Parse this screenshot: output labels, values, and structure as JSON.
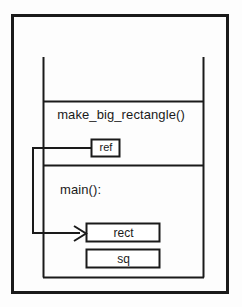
{
  "diagram": {
    "type": "memory-reference-diagram",
    "colors": {
      "stroke": "#1a1a1a",
      "background": "#fdfdfd",
      "text": "#1a1a1a"
    },
    "outer_border": {
      "name": "outer-border",
      "x": 12,
      "y": 15,
      "width": 216,
      "height": 278,
      "stroke_width": 3
    },
    "stack_frame": {
      "name": "stack-frame-column",
      "left_x": 43,
      "right_x": 203,
      "top_y": 57,
      "bottom_y": 277,
      "stroke_width": 2,
      "dividers": [
        101,
        165
      ]
    },
    "frames": [
      {
        "name": "make-big-rectangle-frame",
        "label": "make_big_rectangle()"
      },
      {
        "name": "main-frame",
        "label": "main():"
      }
    ],
    "boxes": [
      {
        "name": "ref-box",
        "label": "ref",
        "x": 91,
        "y": 139,
        "width": 29,
        "height": 18
      },
      {
        "name": "rect-box",
        "label": "rect",
        "x": 86,
        "y": 223,
        "width": 74,
        "height": 19
      },
      {
        "name": "sq-box",
        "label": "sq",
        "x": 86,
        "y": 249,
        "width": 74,
        "height": 19
      }
    ],
    "connector": {
      "name": "ref-to-rect-arrow",
      "description": "line from ref box left edge going left, down, then right with arrowhead into rect box",
      "points": "91,148 33,148 33,233 85,233",
      "arrow_tip_x": 86,
      "arrow_tip_y": 233,
      "stroke_width": 2
    }
  }
}
